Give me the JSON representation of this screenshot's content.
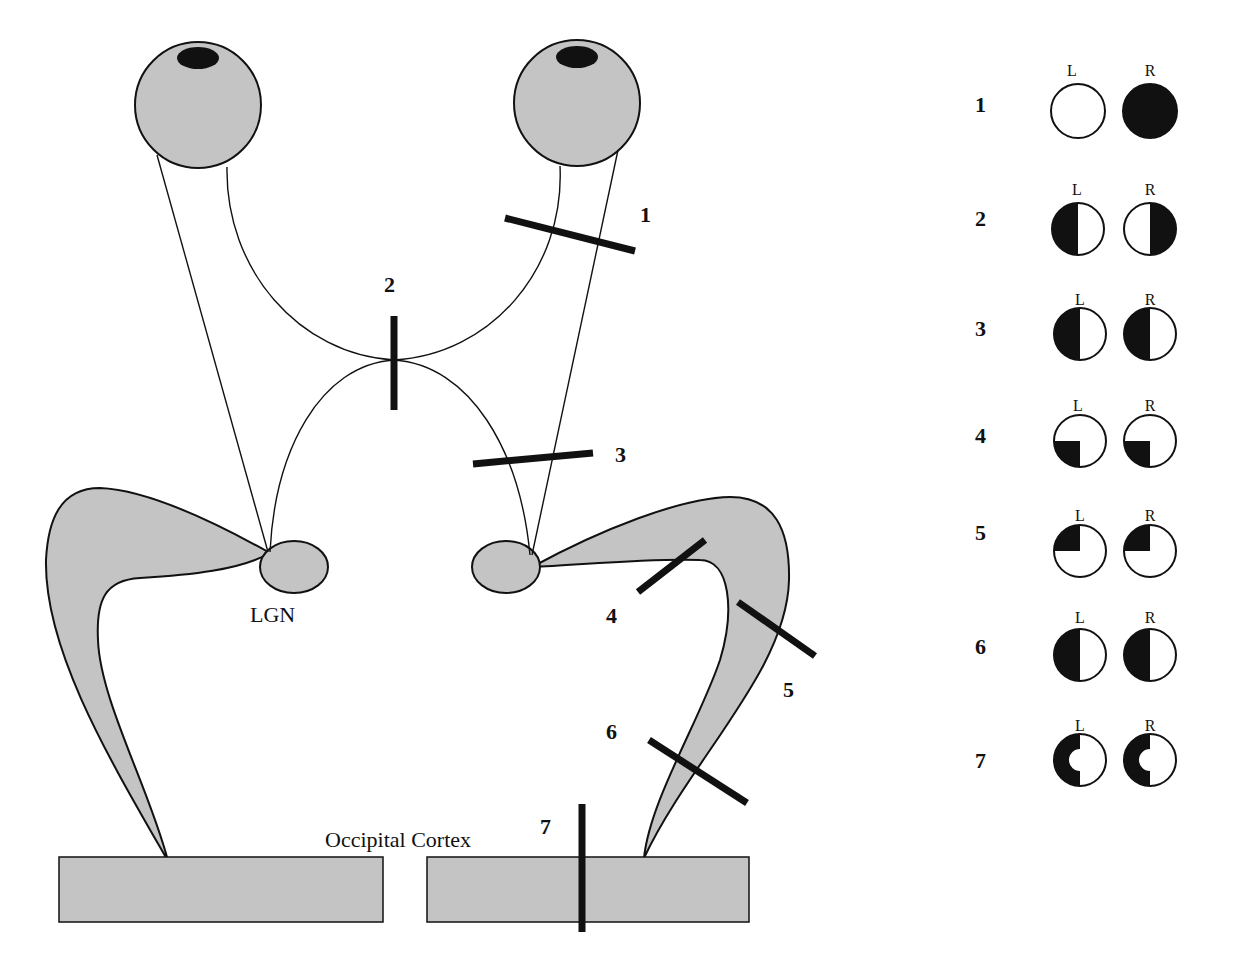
{
  "diagram": {
    "colors": {
      "tissue_fill": "#c4c4c4",
      "outline": "#111111",
      "lesion": "#111111",
      "field_loss": "#111111",
      "field_intact": "#ffffff"
    },
    "labels": {
      "lgn": "LGN",
      "cortex": "Occipital Cortex"
    },
    "structures": [
      "left eye",
      "right eye",
      "optic nerves",
      "optic chiasm",
      "optic tracts",
      "left LGN",
      "right LGN",
      "optic radiations",
      "occipital cortex"
    ],
    "lesions": [
      {
        "id": "1",
        "label": "1",
        "site": "right optic nerve"
      },
      {
        "id": "2",
        "label": "2",
        "site": "optic chiasm"
      },
      {
        "id": "3",
        "label": "3",
        "site": "right optic tract"
      },
      {
        "id": "4",
        "label": "4",
        "site": "right optic radiation (upper limb)"
      },
      {
        "id": "5",
        "label": "5",
        "site": "right optic radiation (lower limb)"
      },
      {
        "id": "6",
        "label": "6",
        "site": "right optic radiation (distal)"
      },
      {
        "id": "7",
        "label": "7",
        "site": "right occipital cortex"
      }
    ]
  },
  "legend": {
    "eye_left_label": "L",
    "eye_right_label": "R",
    "rows": [
      {
        "label": "1",
        "left": "intact",
        "right": "full loss"
      },
      {
        "label": "2",
        "left": "left half loss",
        "right": "right half loss"
      },
      {
        "label": "3",
        "left": "left half loss",
        "right": "left half loss"
      },
      {
        "label": "4",
        "left": "lower-left quadrant loss",
        "right": "lower-left quadrant loss"
      },
      {
        "label": "5",
        "left": "upper-left quadrant loss",
        "right": "upper-left quadrant loss"
      },
      {
        "label": "6",
        "left": "left half loss",
        "right": "left half loss"
      },
      {
        "label": "7",
        "left": "left half loss with macular sparing",
        "right": "left half loss with macular sparing"
      }
    ]
  }
}
